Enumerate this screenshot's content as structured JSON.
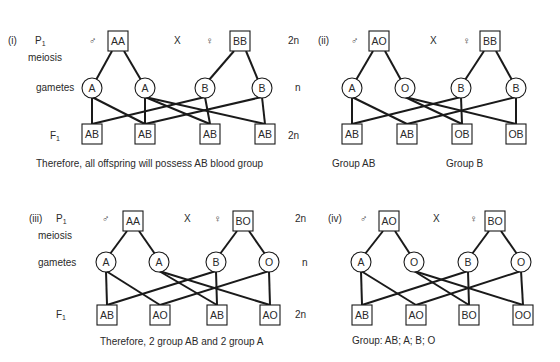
{
  "panels": [
    {
      "id": "i",
      "label": "(i)",
      "label_pos": [
        8,
        44
      ],
      "row_labels": [
        {
          "key": "p1",
          "text": "P",
          "sub": "1",
          "pos": [
            35,
            44
          ]
        },
        {
          "key": "meiosis",
          "text": "meiosis",
          "pos": [
            28,
            61
          ]
        },
        {
          "key": "gametes",
          "text": "gametes",
          "pos": [
            36,
            91
          ]
        },
        {
          "key": "f1",
          "text": "F",
          "sub": "1",
          "pos": [
            50,
            139
          ]
        }
      ],
      "ploidy_labels": [
        {
          "text": "2n",
          "pos": [
            288,
            44
          ]
        },
        {
          "text": "n",
          "pos": [
            295,
            91
          ]
        },
        {
          "text": "2n",
          "pos": [
            288,
            139
          ]
        }
      ],
      "male_symbol": {
        "text": "♂",
        "pos": [
          89,
          44
        ]
      },
      "cross_symbol": {
        "text": "X",
        "pos": [
          174,
          44
        ]
      },
      "female_symbol": {
        "text": "♀",
        "pos": [
          206,
          44
        ]
      },
      "parents": [
        {
          "genotype": "AA",
          "x": 108,
          "y": 31,
          "w": 20,
          "h": 20
        },
        {
          "genotype": "BB",
          "x": 230,
          "y": 31,
          "w": 20,
          "h": 20
        }
      ],
      "gametes": [
        {
          "allele": "A",
          "cx": 92,
          "cy": 88
        },
        {
          "allele": "A",
          "cx": 145,
          "cy": 88
        },
        {
          "allele": "B",
          "cx": 205,
          "cy": 88
        },
        {
          "allele": "B",
          "cx": 262,
          "cy": 88
        }
      ],
      "offspring": [
        {
          "genotype": "AB",
          "x": 82,
          "y": 124,
          "w": 20,
          "h": 20
        },
        {
          "genotype": "AB",
          "x": 135,
          "y": 124,
          "w": 20,
          "h": 20
        },
        {
          "genotype": "AB",
          "x": 200,
          "y": 124,
          "w": 20,
          "h": 20
        },
        {
          "genotype": "AB",
          "x": 255,
          "y": 124,
          "w": 20,
          "h": 20
        }
      ],
      "gamete_edges": [
        [
          0,
          0
        ],
        [
          0,
          1
        ],
        [
          1,
          1
        ],
        [
          1,
          2
        ],
        [
          1,
          3
        ],
        [
          2,
          0
        ],
        [
          2,
          2
        ],
        [
          3,
          1
        ],
        [
          3,
          3
        ]
      ],
      "conclusions": [
        {
          "text": "Therefore, all offspring will possess AB blood group",
          "pos": [
            36,
            167
          ]
        }
      ]
    },
    {
      "id": "ii",
      "label": "(ii)",
      "label_pos": [
        318,
        44
      ],
      "row_labels": [],
      "ploidy_labels": [],
      "male_symbol": {
        "text": "♂",
        "pos": [
          351,
          44
        ]
      },
      "cross_symbol": {
        "text": "X",
        "pos": [
          430,
          44
        ]
      },
      "female_symbol": {
        "text": "♀",
        "pos": [
          463,
          44
        ]
      },
      "parents": [
        {
          "genotype": "AO",
          "x": 369,
          "y": 31,
          "w": 20,
          "h": 20
        },
        {
          "genotype": "BB",
          "x": 480,
          "y": 31,
          "w": 20,
          "h": 20
        }
      ],
      "gametes": [
        {
          "allele": "A",
          "cx": 352,
          "cy": 88
        },
        {
          "allele": "O",
          "cx": 405,
          "cy": 88
        },
        {
          "allele": "B",
          "cx": 461,
          "cy": 88
        },
        {
          "allele": "B",
          "cx": 516,
          "cy": 88
        }
      ],
      "offspring": [
        {
          "genotype": "AB",
          "x": 342,
          "y": 124,
          "w": 20,
          "h": 20
        },
        {
          "genotype": "AB",
          "x": 397,
          "y": 124,
          "w": 20,
          "h": 20
        },
        {
          "genotype": "OB",
          "x": 452,
          "y": 124,
          "w": 20,
          "h": 20
        },
        {
          "genotype": "OB",
          "x": 506,
          "y": 124,
          "w": 20,
          "h": 20
        }
      ],
      "gamete_edges": [
        [
          0,
          0
        ],
        [
          0,
          1
        ],
        [
          1,
          2
        ],
        [
          1,
          3
        ],
        [
          2,
          0
        ],
        [
          2,
          2
        ],
        [
          3,
          1
        ],
        [
          3,
          3
        ]
      ],
      "conclusions": [
        {
          "text": "Group AB",
          "pos": [
            332,
            167
          ]
        },
        {
          "text": "Group B",
          "pos": [
            446,
            167
          ]
        }
      ]
    },
    {
      "id": "iii",
      "label": "(iii)",
      "label_pos": [
        29,
        222
      ],
      "row_labels": [
        {
          "key": "p1",
          "text": "P",
          "sub": "1",
          "pos": [
            56,
            222
          ]
        },
        {
          "key": "meiosis",
          "text": "meiosis",
          "pos": [
            38,
            239
          ]
        },
        {
          "key": "gametes",
          "text": "gametes",
          "pos": [
            38,
            266
          ]
        },
        {
          "key": "f1",
          "text": "F",
          "sub": "1",
          "pos": [
            56,
            318
          ]
        }
      ],
      "ploidy_labels": [
        {
          "text": "2n",
          "pos": [
            295,
            222
          ]
        },
        {
          "text": "n",
          "pos": [
            302,
            266
          ]
        },
        {
          "text": "2n",
          "pos": [
            295,
            318
          ]
        }
      ],
      "male_symbol": {
        "text": "♂",
        "pos": [
          102,
          222
        ]
      },
      "cross_symbol": {
        "text": "X",
        "pos": [
          184,
          222
        ]
      },
      "female_symbol": {
        "text": "♀",
        "pos": [
          214,
          222
        ]
      },
      "parents": [
        {
          "genotype": "AA",
          "x": 123,
          "y": 211,
          "w": 20,
          "h": 20
        },
        {
          "genotype": "BO",
          "x": 233,
          "y": 211,
          "w": 20,
          "h": 20
        }
      ],
      "gametes": [
        {
          "allele": "A",
          "cx": 106,
          "cy": 262
        },
        {
          "allele": "A",
          "cx": 159,
          "cy": 262
        },
        {
          "allele": "B",
          "cx": 216,
          "cy": 262
        },
        {
          "allele": "O",
          "cx": 269,
          "cy": 262
        }
      ],
      "offspring": [
        {
          "genotype": "AB",
          "x": 97,
          "y": 305,
          "w": 20,
          "h": 20
        },
        {
          "genotype": "AO",
          "x": 150,
          "y": 305,
          "w": 20,
          "h": 20
        },
        {
          "genotype": "AB",
          "x": 207,
          "y": 305,
          "w": 20,
          "h": 20
        },
        {
          "genotype": "AO",
          "x": 260,
          "y": 305,
          "w": 20,
          "h": 20
        }
      ],
      "gamete_edges": [
        [
          0,
          0
        ],
        [
          0,
          1
        ],
        [
          1,
          2
        ],
        [
          1,
          3
        ],
        [
          2,
          0
        ],
        [
          2,
          2
        ],
        [
          3,
          1
        ],
        [
          3,
          3
        ]
      ],
      "conclusions": [
        {
          "text": "Therefore, 2 group AB and 2 group A",
          "pos": [
            100,
            345
          ]
        }
      ]
    },
    {
      "id": "iv",
      "label": "(iv)",
      "label_pos": [
        328,
        222
      ],
      "row_labels": [],
      "ploidy_labels": [],
      "male_symbol": {
        "text": "♂",
        "pos": [
          360,
          222
        ]
      },
      "cross_symbol": {
        "text": "X",
        "pos": [
          433,
          222
        ]
      },
      "female_symbol": {
        "text": "♀",
        "pos": [
          470,
          222
        ]
      },
      "parents": [
        {
          "genotype": "AO",
          "x": 379,
          "y": 211,
          "w": 20,
          "h": 20
        },
        {
          "genotype": "BO",
          "x": 485,
          "y": 211,
          "w": 20,
          "h": 20
        }
      ],
      "gametes": [
        {
          "allele": "A",
          "cx": 361,
          "cy": 262
        },
        {
          "allele": "O",
          "cx": 414,
          "cy": 262
        },
        {
          "allele": "B",
          "cx": 468,
          "cy": 262
        },
        {
          "allele": "O",
          "cx": 521,
          "cy": 262
        }
      ],
      "offspring": [
        {
          "genotype": "AB",
          "x": 352,
          "y": 305,
          "w": 20,
          "h": 20
        },
        {
          "genotype": "AO",
          "x": 406,
          "y": 305,
          "w": 20,
          "h": 20
        },
        {
          "genotype": "BO",
          "x": 459,
          "y": 305,
          "w": 20,
          "h": 20
        },
        {
          "genotype": "OO",
          "x": 513,
          "y": 305,
          "w": 20,
          "h": 20
        }
      ],
      "gamete_edges": [
        [
          0,
          0
        ],
        [
          0,
          1
        ],
        [
          1,
          2
        ],
        [
          1,
          3
        ],
        [
          2,
          0
        ],
        [
          2,
          2
        ],
        [
          3,
          1
        ],
        [
          3,
          3
        ]
      ],
      "conclusions": [
        {
          "text": "Group:  AB; A; B; O",
          "pos": [
            352,
            344
          ]
        }
      ]
    }
  ],
  "style": {
    "line_color": "#1a1a1a",
    "text_color": "#2a2a2a",
    "background": "#ffffff",
    "gamete_radius": 10
  }
}
